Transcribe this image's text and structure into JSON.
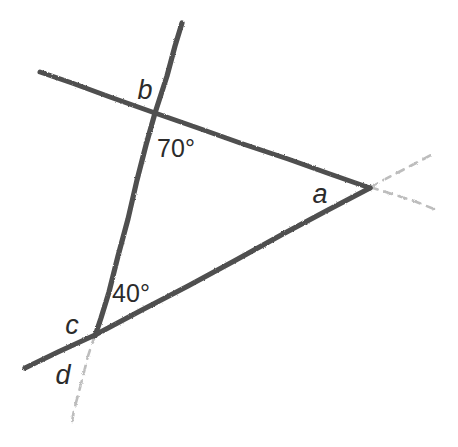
{
  "diagram": {
    "width": 458,
    "height": 447,
    "background_color": "#ffffff",
    "stroke_color": "#4f4f4f",
    "faint_stroke_color": "#b9b9b9",
    "label_color": "#2b2b2b",
    "labels": {
      "a": "a",
      "b": "b",
      "c": "c",
      "d": "d",
      "angle_top": "70°",
      "angle_bottom": "40°"
    },
    "label_positions": {
      "a": {
        "x": 320,
        "y": 194
      },
      "b": {
        "x": 145,
        "y": 90
      },
      "c": {
        "x": 72,
        "y": 325
      },
      "d": {
        "x": 63,
        "y": 375
      },
      "angle_top": {
        "x": 176,
        "y": 148
      },
      "angle_bottom": {
        "x": 131,
        "y": 293
      }
    },
    "vertices": {
      "b_intersection": {
        "x": 155,
        "y": 113
      },
      "a_intersection": {
        "x": 370,
        "y": 187
      },
      "c_intersection": {
        "x": 95,
        "y": 335
      },
      "steep_line_top_end": {
        "x": 182,
        "y": 23
      },
      "top_line_left_end": {
        "x": 40,
        "y": 72
      },
      "bottom_line_left_end": {
        "x": 25,
        "y": 368
      },
      "faint_below_c_end": {
        "x": 72,
        "y": 420
      },
      "faint_upper_right_end": {
        "x": 432,
        "y": 155
      },
      "faint_lower_right_end": {
        "x": 434,
        "y": 208
      }
    },
    "angle_values": {
      "top_degrees": 70,
      "bottom_degrees": 40
    }
  }
}
